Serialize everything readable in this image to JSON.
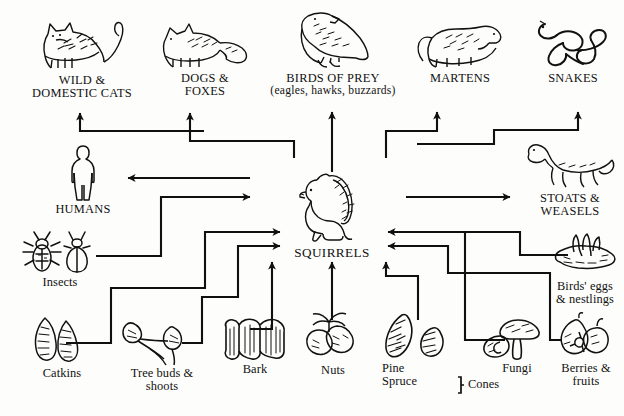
{
  "diagram": {
    "background": "#fdfdfb",
    "ink": "#101010",
    "predators": [
      {
        "id": "cats",
        "icon": "cat-icon",
        "label": "WILD &\nDOMESTIC CATS"
      },
      {
        "id": "dogs",
        "icon": "fox-icon",
        "label": "DOGS &\nFOXES"
      },
      {
        "id": "birds",
        "icon": "bird-of-prey-icon",
        "label": "BIRDS OF PREY",
        "sublabel": "(eagles, hawks, buzzards)"
      },
      {
        "id": "martens",
        "icon": "marten-icon",
        "label": "MARTENS"
      },
      {
        "id": "snakes",
        "icon": "snake-icon",
        "label": "SNAKES"
      },
      {
        "id": "humans",
        "icon": "human-icon",
        "label": "HUMANS"
      },
      {
        "id": "stoats",
        "icon": "stoat-icon",
        "label": "STOATS &\nWEASELS"
      }
    ],
    "center": {
      "id": "squirrels",
      "icon": "squirrel-icon",
      "label": "SQUIRRELS"
    },
    "foods": [
      {
        "id": "insects",
        "icon": "insects-icon",
        "label": "Insects"
      },
      {
        "id": "catkins",
        "icon": "catkins-icon",
        "label": "Catkins"
      },
      {
        "id": "buds",
        "icon": "tree-buds-icon",
        "label": "Tree buds &\nshoots"
      },
      {
        "id": "bark",
        "icon": "bark-icon",
        "label": "Bark"
      },
      {
        "id": "nuts",
        "icon": "nuts-icon",
        "label": "Nuts"
      },
      {
        "id": "cones",
        "icon": "cones-icon",
        "label": "Pine\nSpruce",
        "bracket_label": "Cones"
      },
      {
        "id": "fungi",
        "icon": "fungi-icon",
        "label": "Fungi"
      },
      {
        "id": "eggs",
        "icon": "birds-eggs-icon",
        "label": "Birds' eggs\n& nestlings"
      },
      {
        "id": "berries",
        "icon": "berries-icon",
        "label": "Berries &\nfruits"
      }
    ],
    "flows": [
      {
        "from": "squirrels",
        "to": "cats"
      },
      {
        "from": "squirrels",
        "to": "dogs"
      },
      {
        "from": "squirrels",
        "to": "birds"
      },
      {
        "from": "squirrels",
        "to": "martens"
      },
      {
        "from": "squirrels",
        "to": "snakes"
      },
      {
        "from": "squirrels",
        "to": "humans"
      },
      {
        "from": "squirrels",
        "to": "stoats"
      },
      {
        "from": "insects",
        "to": "squirrels"
      },
      {
        "from": "catkins",
        "to": "squirrels"
      },
      {
        "from": "buds",
        "to": "squirrels"
      },
      {
        "from": "bark",
        "to": "squirrels"
      },
      {
        "from": "nuts",
        "to": "squirrels"
      },
      {
        "from": "cones",
        "to": "squirrels"
      },
      {
        "from": "fungi",
        "to": "squirrels"
      },
      {
        "from": "eggs",
        "to": "squirrels"
      },
      {
        "from": "berries",
        "to": "squirrels"
      }
    ]
  }
}
